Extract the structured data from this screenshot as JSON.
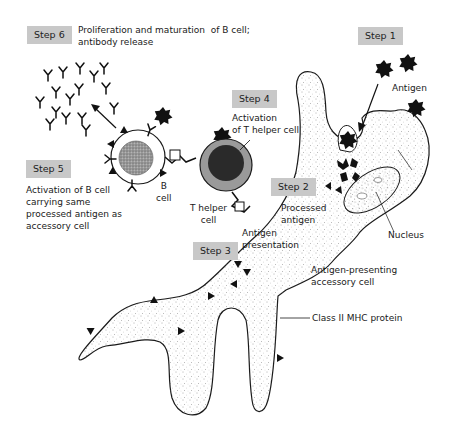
{
  "diagram": {
    "type": "biology-process",
    "steps": [
      {
        "id": "step1",
        "label": "Step 1",
        "description": ""
      },
      {
        "id": "step2",
        "label": "Step 2",
        "description": "Processed antigen"
      },
      {
        "id": "step3",
        "label": "Step 3",
        "description": "Antigen presentation"
      },
      {
        "id": "step4",
        "label": "Step 4",
        "description": "Activation of T helper cell"
      },
      {
        "id": "step5",
        "label": "Step 5",
        "description": "Activation of B cell carrying same processed antigen as accessory cell"
      },
      {
        "id": "step6",
        "label": "Step 6",
        "description": "Proliferation and maturation of B cell; antibody release"
      }
    ],
    "labels": {
      "antigen": "Antigen",
      "processed_antigen": "Processed\nantigen",
      "antigen_presentation": "Antigen\npresentation",
      "nucleus": "Nucleus",
      "apc": "Antigen-presenting\naccessory cell",
      "mhc": "Class II MHC protein",
      "b_cell": "B\ncell",
      "t_helper": "T helper\ncell",
      "step4_text": "Activation\nof T helper cell",
      "step5_text": "Activation of B cell\ncarrying same\nprocessed antigen as\naccessory cell",
      "step6_text": "Proliferation and maturation  of B cell;\nantibody release"
    },
    "colors": {
      "step_box": "#c8c8c8",
      "outline": "#1a1a1a",
      "cell_fill": "#ffffff",
      "b_nucleus": "#8a8a8a",
      "t_ring": "#9a9a9a",
      "t_core": "#2a2a2a"
    }
  }
}
